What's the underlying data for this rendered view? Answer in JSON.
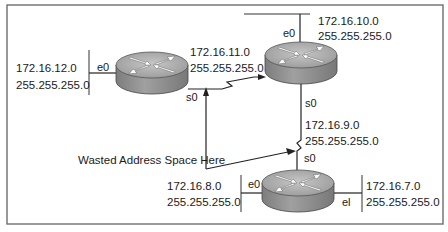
{
  "diagram": {
    "annotation": "Wasted Address Space Here",
    "routers": [
      {
        "id": "router-a",
        "interfaces": [
          {
            "name": "e0",
            "network": "172.16.12.0",
            "mask": "255.255.255.0"
          },
          {
            "name": "s0"
          }
        ]
      },
      {
        "id": "router-b",
        "interfaces": [
          {
            "name": "e0",
            "network": "172.16.10.0",
            "mask": "255.255.255.0"
          },
          {
            "name": "s0"
          }
        ]
      },
      {
        "id": "router-c",
        "interfaces": [
          {
            "name": "s0"
          },
          {
            "name": "e0",
            "network": "172.16.8.0",
            "mask": "255.255.255.0"
          },
          {
            "name": "el",
            "network": "172.16.7.0",
            "mask": "255.255.255.0"
          }
        ]
      }
    ],
    "serial_links": [
      {
        "between": [
          "router-a",
          "router-b"
        ],
        "network": "172.16.11.0",
        "mask": "255.255.255.0"
      },
      {
        "between": [
          "router-b",
          "router-c"
        ],
        "network": "172.16.9.0",
        "mask": "255.255.255.0"
      }
    ],
    "colors": {
      "router_top": "#b8b8b8",
      "router_side": "#8c8c8c",
      "arrows": "#ffffff",
      "frame": "#6e6e6e",
      "lines": "#222222"
    }
  }
}
